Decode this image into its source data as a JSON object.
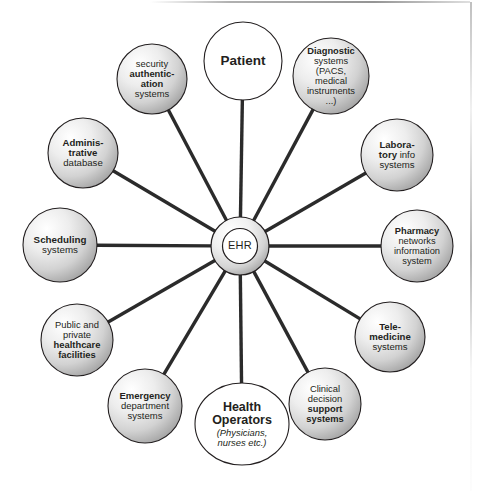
{
  "diagram": {
    "title": "EHR",
    "hub": {
      "label": "EHR",
      "cx": 240,
      "cy": 246,
      "outer_r": 29,
      "inner_r": 17.5
    },
    "colors": {
      "stroke": "#231f20",
      "text": "#231f20",
      "spoke": "#2b2b2b",
      "background": "#ffffff",
      "gradient_light": "#ffffff",
      "gradient_mid": "#d9d9d9",
      "gradient_dark": "#9a9a9a"
    },
    "nodes": [
      {
        "id": "patient",
        "name": "Patient",
        "cx": 243,
        "cy": 61,
        "r": 39,
        "shape": "circle",
        "fill": "white",
        "font_size": 13.5,
        "label_width": 84,
        "lines": [
          {
            "text": "Patient",
            "style": "bold"
          }
        ]
      },
      {
        "id": "diagnostic-systems",
        "name": "Diagnostic systems",
        "cx": 331,
        "cy": 76,
        "r": 38,
        "shape": "circle",
        "fill": "gradient",
        "font_size": 9.3,
        "label_width": 72,
        "lines": [
          {
            "text": "Diagnostic",
            "style": "bold"
          },
          {
            "text": "systems",
            "style": "regular"
          },
          {
            "text": "(PACS,",
            "style": "regular"
          },
          {
            "text": "medical",
            "style": "regular"
          },
          {
            "text": "instruments",
            "style": "regular"
          },
          {
            "text": "...)",
            "style": "regular"
          }
        ]
      },
      {
        "id": "laboratory-info-systems",
        "name": "Laboratory info systems",
        "cx": 397,
        "cy": 155,
        "r": 36,
        "shape": "circle",
        "fill": "gradient",
        "font_size": 9.6,
        "label_width": 72,
        "lines": [
          {
            "text": "Labora-",
            "style": "bold"
          },
          {
            "text": "tory info",
            "style": "mixed-bold-first"
          },
          {
            "text": "systems",
            "style": "regular"
          }
        ]
      },
      {
        "id": "pharmacy-networks",
        "name": "Pharmacy networks information system",
        "cx": 417,
        "cy": 246,
        "r": 36,
        "shape": "circle",
        "fill": "gradient",
        "font_size": 9.3,
        "label_width": 74,
        "lines": [
          {
            "text": "Pharmacy",
            "style": "bold"
          },
          {
            "text": "networks",
            "style": "regular"
          },
          {
            "text": "information",
            "style": "regular"
          },
          {
            "text": "system",
            "style": "regular"
          }
        ]
      },
      {
        "id": "telemedicine-systems",
        "name": "Telemedicine systems",
        "cx": 390,
        "cy": 337,
        "r": 35,
        "shape": "circle",
        "fill": "gradient",
        "font_size": 9.6,
        "label_width": 70,
        "lines": [
          {
            "text": "Tele-",
            "style": "bold"
          },
          {
            "text": "medicine",
            "style": "bold"
          },
          {
            "text": "systems",
            "style": "regular"
          }
        ]
      },
      {
        "id": "clinical-decision-support",
        "name": "Clinical decision support systems",
        "cx": 325,
        "cy": 404,
        "r": 36,
        "shape": "circle",
        "fill": "gradient",
        "font_size": 9.4,
        "label_width": 72,
        "lines": [
          {
            "text": "Clinical",
            "style": "regular"
          },
          {
            "text": "decision",
            "style": "regular"
          },
          {
            "text": "support",
            "style": "bold"
          },
          {
            "text": "systems",
            "style": "bold"
          }
        ]
      },
      {
        "id": "health-operators",
        "name": "Health Operators",
        "cx": 242,
        "cy": 424,
        "rx": 47,
        "ry": 41,
        "shape": "ellipse",
        "fill": "white",
        "font_size": 12.5,
        "label_width": 94,
        "lines": [
          {
            "text": "Health",
            "style": "bold"
          },
          {
            "text": "Operators",
            "style": "bold"
          },
          {
            "text": "(Physicians,",
            "style": "italic",
            "size": 9.4
          },
          {
            "text": "nurses etc.)",
            "style": "italic",
            "size": 9.4
          }
        ]
      },
      {
        "id": "emergency-department-systems",
        "name": "Emergency department systems",
        "cx": 145,
        "cy": 406,
        "r": 37,
        "shape": "circle",
        "fill": "gradient",
        "font_size": 9.5,
        "label_width": 74,
        "lines": [
          {
            "text": "Emergency",
            "style": "bold"
          },
          {
            "text": "department",
            "style": "regular"
          },
          {
            "text": "systems",
            "style": "regular"
          }
        ]
      },
      {
        "id": "healthcare-facilities",
        "name": "Public and private healthcare facilities",
        "cx": 77,
        "cy": 340,
        "r": 36,
        "shape": "circle",
        "fill": "gradient",
        "font_size": 9.4,
        "label_width": 74,
        "lines": [
          {
            "text": "Public and",
            "style": "regular"
          },
          {
            "text": "private",
            "style": "regular"
          },
          {
            "text": "healthcare",
            "style": "bold"
          },
          {
            "text": "facilities",
            "style": "bold"
          }
        ]
      },
      {
        "id": "scheduling-systems",
        "name": "Scheduling systems",
        "cx": 60,
        "cy": 245,
        "r": 37,
        "shape": "circle",
        "fill": "gradient",
        "font_size": 9.8,
        "label_width": 74,
        "lines": [
          {
            "text": "Scheduling",
            "style": "bold"
          },
          {
            "text": "systems",
            "style": "regular"
          }
        ]
      },
      {
        "id": "administrative-database",
        "name": "Administrative database",
        "cx": 83,
        "cy": 153,
        "r": 35,
        "shape": "circle",
        "fill": "gradient",
        "font_size": 9.6,
        "label_width": 72,
        "lines": [
          {
            "text": "Adminis-",
            "style": "bold"
          },
          {
            "text": "trative",
            "style": "bold"
          },
          {
            "text": "database",
            "style": "regular"
          }
        ]
      },
      {
        "id": "security-authentication-systems",
        "name": "security authentication systems",
        "cx": 152,
        "cy": 79,
        "r": 35,
        "shape": "circle",
        "fill": "gradient",
        "font_size": 9.4,
        "label_width": 70,
        "lines": [
          {
            "text": "security",
            "style": "regular"
          },
          {
            "text": "authentic-",
            "style": "bold"
          },
          {
            "text": "ation",
            "style": "bold"
          },
          {
            "text": "systems",
            "style": "regular"
          }
        ]
      }
    ],
    "spokes": [
      {
        "from": "hub",
        "to": "patient"
      },
      {
        "from": "hub",
        "to": "diagnostic-systems"
      },
      {
        "from": "hub",
        "to": "laboratory-info-systems"
      },
      {
        "from": "hub",
        "to": "pharmacy-networks"
      },
      {
        "from": "hub",
        "to": "telemedicine-systems"
      },
      {
        "from": "hub",
        "to": "clinical-decision-support"
      },
      {
        "from": "hub",
        "to": "health-operators"
      },
      {
        "from": "hub",
        "to": "emergency-department-systems"
      },
      {
        "from": "hub",
        "to": "healthcare-facilities"
      },
      {
        "from": "hub",
        "to": "scheduling-systems"
      },
      {
        "from": "hub",
        "to": "administrative-database"
      },
      {
        "from": "hub",
        "to": "security-authentication-systems"
      }
    ]
  }
}
